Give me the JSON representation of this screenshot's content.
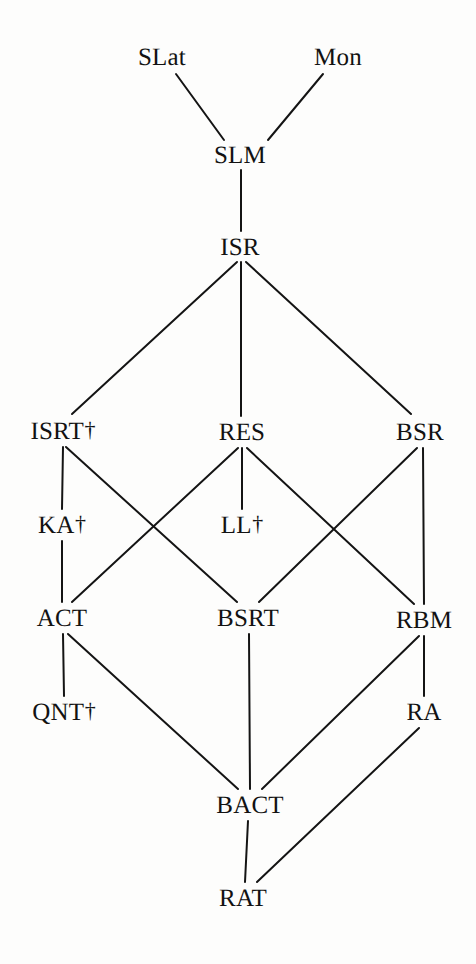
{
  "diagram": {
    "type": "hasse-lattice",
    "title": "",
    "background_color": "#fdfdfc",
    "line_color": "#141414",
    "text_color": "#121212",
    "dagger_symbol": "†",
    "nodes": [
      {
        "id": "SLat",
        "label": "SLat",
        "dagger": false,
        "x": 162,
        "y": 57,
        "level": 0
      },
      {
        "id": "Mon",
        "label": "Mon",
        "dagger": false,
        "x": 338,
        "y": 57,
        "level": 0
      },
      {
        "id": "SLM",
        "label": "SLM",
        "dagger": false,
        "x": 240,
        "y": 155,
        "level": 1
      },
      {
        "id": "ISR",
        "label": "ISR",
        "dagger": false,
        "x": 240,
        "y": 247,
        "level": 2
      },
      {
        "id": "ISRT",
        "label": "ISRT",
        "dagger": true,
        "x": 63,
        "y": 431,
        "level": 3
      },
      {
        "id": "RES",
        "label": "RES",
        "dagger": false,
        "x": 242,
        "y": 432,
        "level": 3
      },
      {
        "id": "BSR",
        "label": "BSR",
        "dagger": false,
        "x": 420,
        "y": 432,
        "level": 3
      },
      {
        "id": "KA",
        "label": "KA",
        "dagger": true,
        "x": 62,
        "y": 525,
        "level": 4
      },
      {
        "id": "LL",
        "label": "LL",
        "dagger": true,
        "x": 242,
        "y": 525,
        "level": 4
      },
      {
        "id": "ACT",
        "label": "ACT",
        "dagger": false,
        "x": 62,
        "y": 618,
        "level": 5
      },
      {
        "id": "BSRT",
        "label": "BSRT",
        "dagger": false,
        "x": 248,
        "y": 618,
        "level": 5
      },
      {
        "id": "RBM",
        "label": "RBM",
        "dagger": false,
        "x": 424,
        "y": 620,
        "level": 5
      },
      {
        "id": "QNT",
        "label": "QNT",
        "dagger": true,
        "x": 64,
        "y": 712,
        "level": 6
      },
      {
        "id": "RA",
        "label": "RA",
        "dagger": false,
        "x": 424,
        "y": 712,
        "level": 6
      },
      {
        "id": "BACT",
        "label": "BACT",
        "dagger": false,
        "x": 250,
        "y": 805,
        "level": 7
      },
      {
        "id": "RAT",
        "label": "RAT",
        "dagger": false,
        "x": 243,
        "y": 898,
        "level": 8
      }
    ],
    "edges": [
      {
        "from": "SLat",
        "to": "SLM",
        "x1": 176,
        "y1": 74,
        "x2": 224,
        "y2": 140
      },
      {
        "from": "Mon",
        "to": "SLM",
        "x1": 323,
        "y1": 74,
        "x2": 268,
        "y2": 140
      },
      {
        "from": "SLM",
        "to": "ISR",
        "x1": 241,
        "y1": 170,
        "x2": 241,
        "y2": 231
      },
      {
        "from": "ISR",
        "to": "ISRT",
        "x1": 237,
        "y1": 262,
        "x2": 72,
        "y2": 414
      },
      {
        "from": "ISR",
        "to": "RES",
        "x1": 241,
        "y1": 262,
        "x2": 241,
        "y2": 416
      },
      {
        "from": "ISR",
        "to": "BSR",
        "x1": 246,
        "y1": 262,
        "x2": 411,
        "y2": 414
      },
      {
        "from": "ISRT",
        "to": "KA",
        "x1": 63,
        "y1": 447,
        "x2": 62,
        "y2": 509
      },
      {
        "from": "ISRT",
        "to": "BSRT",
        "x1": 66,
        "y1": 447,
        "x2": 237,
        "y2": 602
      },
      {
        "from": "RES",
        "to": "ACT",
        "x1": 238,
        "y1": 448,
        "x2": 72,
        "y2": 602
      },
      {
        "from": "RES",
        "to": "LL",
        "x1": 242,
        "y1": 448,
        "x2": 242,
        "y2": 509
      },
      {
        "from": "RES",
        "to": "RBM",
        "x1": 247,
        "y1": 448,
        "x2": 414,
        "y2": 604
      },
      {
        "from": "BSR",
        "to": "BSRT",
        "x1": 417,
        "y1": 448,
        "x2": 259,
        "y2": 602
      },
      {
        "from": "BSR",
        "to": "RBM",
        "x1": 423,
        "y1": 448,
        "x2": 424,
        "y2": 604
      },
      {
        "from": "KA",
        "to": "ACT",
        "x1": 62,
        "y1": 541,
        "x2": 62,
        "y2": 602
      },
      {
        "from": "ACT",
        "to": "QNT",
        "x1": 63,
        "y1": 634,
        "x2": 64,
        "y2": 696
      },
      {
        "from": "ACT",
        "to": "BACT",
        "x1": 68,
        "y1": 634,
        "x2": 238,
        "y2": 789
      },
      {
        "from": "BSRT",
        "to": "BACT",
        "x1": 249,
        "y1": 634,
        "x2": 250,
        "y2": 789
      },
      {
        "from": "RBM",
        "to": "RA",
        "x1": 424,
        "y1": 636,
        "x2": 424,
        "y2": 696
      },
      {
        "from": "RBM",
        "to": "BACT",
        "x1": 419,
        "y1": 636,
        "x2": 262,
        "y2": 789
      },
      {
        "from": "BACT",
        "to": "RAT",
        "x1": 248,
        "y1": 821,
        "x2": 245,
        "y2": 882
      },
      {
        "from": "RA",
        "to": "RAT",
        "x1": 419,
        "y1": 728,
        "x2": 257,
        "y2": 882
      }
    ]
  }
}
